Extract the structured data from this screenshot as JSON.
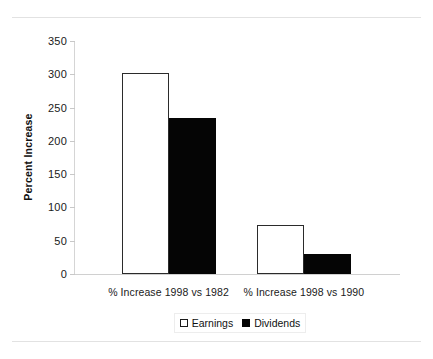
{
  "chart_data": {
    "type": "bar",
    "title": "",
    "xlabel": "",
    "ylabel": "Percent Increase",
    "categories": [
      "% Increase 1998 vs 1982",
      "% Increase 1998 vs 1990"
    ],
    "series": [
      {
        "name": "Earnings",
        "color": "#ffffff",
        "edge_color": "#2b2b2b",
        "values": [
          302,
          73
        ]
      },
      {
        "name": "Dividends",
        "color": "#050505",
        "edge_color": "#050505",
        "values": [
          235,
          30
        ]
      }
    ],
    "ylim": [
      0,
      350
    ],
    "ytick_labels": [
      "0",
      "50",
      "100",
      "150",
      "200",
      "250",
      "300",
      "350"
    ],
    "ytick_values": [
      0,
      50,
      100,
      150,
      200,
      250,
      300,
      350
    ],
    "grid": false,
    "legend_position": "bottom-center"
  },
  "legend": {
    "entries": [
      {
        "label": "Earnings",
        "marker": "square-outline"
      },
      {
        "label": "Dividends",
        "marker": "square-filled"
      }
    ]
  },
  "frame": {
    "top_rule": "",
    "bottom_rule": ""
  }
}
